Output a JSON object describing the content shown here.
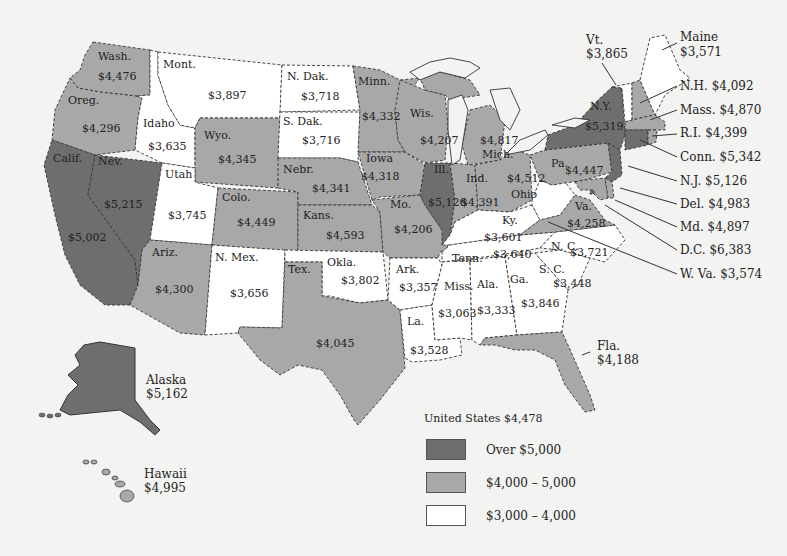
{
  "colors": {
    "over_5000": "#6e6e6e",
    "range_4000_5000": "#a8a8a8",
    "range_3000_4000": "#ffffff",
    "background": "#f3f3f1"
  },
  "states": {
    "wash": {
      "name": "Wash.",
      "value": "$4,476",
      "category": "range_4000_5000"
    },
    "oreg": {
      "name": "Oreg.",
      "value": "$4,296",
      "category": "range_4000_5000"
    },
    "calif": {
      "name": "Calif.",
      "value": "$5,002",
      "category": "over_5000"
    },
    "nev": {
      "name": "Nev.",
      "value": "$5,215",
      "category": "over_5000"
    },
    "idaho": {
      "name": "Idaho",
      "value": "$3,635",
      "category": "range_3000_4000"
    },
    "mont": {
      "name": "Mont.",
      "value": "$3,897",
      "category": "range_3000_4000"
    },
    "wyo": {
      "name": "Wyo.",
      "value": "$4,345",
      "category": "range_4000_5000"
    },
    "utah": {
      "name": "Utah",
      "value": "$3,745",
      "category": "range_3000_4000"
    },
    "colo": {
      "name": "Colo.",
      "value": "$4,449",
      "category": "range_4000_5000"
    },
    "ariz": {
      "name": "Ariz.",
      "value": "$4,300",
      "category": "range_4000_5000"
    },
    "nmex": {
      "name": "N. Mex.",
      "value": "$3,656",
      "category": "range_3000_4000"
    },
    "ndak": {
      "name": "N. Dak.",
      "value": "$3,718",
      "category": "range_3000_4000"
    },
    "sdak": {
      "name": "S. Dak.",
      "value": "$3,716",
      "category": "range_3000_4000"
    },
    "nebr": {
      "name": "Nebr.",
      "value": "$4,341",
      "category": "range_4000_5000"
    },
    "kans": {
      "name": "Kans.",
      "value": "$4,593",
      "category": "range_4000_5000"
    },
    "okla": {
      "name": "Okla.",
      "value": "$3,802",
      "category": "range_3000_4000"
    },
    "tex": {
      "name": "Tex.",
      "value": "$4,045",
      "category": "range_4000_5000"
    },
    "minn": {
      "name": "Minn.",
      "value": "$4,332",
      "category": "range_4000_5000"
    },
    "iowa": {
      "name": "Iowa",
      "value": "$4,318",
      "category": "range_4000_5000"
    },
    "mo": {
      "name": "Mo.",
      "value": "$4,206",
      "category": "range_4000_5000"
    },
    "ark": {
      "name": "Ark.",
      "value": "$3,357",
      "category": "range_3000_4000"
    },
    "la": {
      "name": "La.",
      "value": "$3,528",
      "category": "range_3000_4000"
    },
    "wis": {
      "name": "Wis.",
      "value": "$4,207",
      "category": "range_4000_5000"
    },
    "ill": {
      "name": "Ill.",
      "value": "$5,126",
      "category": "over_5000"
    },
    "mich": {
      "name": "Mich.",
      "value": "$4,817",
      "category": "range_4000_5000"
    },
    "ind": {
      "name": "Ind.",
      "value": "$4,391",
      "category": "range_4000_5000"
    },
    "ohio": {
      "name": "Ohio",
      "value": "$4,512",
      "category": "range_4000_5000"
    },
    "ky": {
      "name": "Ky.",
      "value": "$3,601",
      "category": "range_3000_4000"
    },
    "tenn": {
      "name": "Tenn.",
      "value": "$3,640",
      "category": "range_3000_4000"
    },
    "miss": {
      "name": "Miss.",
      "value": "$3,063",
      "category": "range_3000_4000"
    },
    "ala": {
      "name": "Ala.",
      "value": "$3,333",
      "category": "range_3000_4000"
    },
    "ga": {
      "name": "Ga.",
      "value": "$3,846",
      "category": "range_3000_4000"
    },
    "fla": {
      "name": "Fla.",
      "value": "$4,188",
      "category": "range_4000_5000"
    },
    "sc": {
      "name": "S. C.",
      "value": "$3,448",
      "category": "range_3000_4000"
    },
    "nc": {
      "name": "N. C.",
      "value": "$3,721",
      "category": "range_3000_4000"
    },
    "va": {
      "name": "Va.",
      "value": "$4,258",
      "category": "range_4000_5000"
    },
    "wva": {
      "name": "W. Va.",
      "value": "$3,574",
      "category": "range_3000_4000"
    },
    "pa": {
      "name": "Pa.",
      "value": "$4,447",
      "category": "range_4000_5000"
    },
    "ny": {
      "name": "N.Y.",
      "value": "$5,319",
      "category": "over_5000"
    },
    "vt": {
      "name": "Vt.",
      "value": "$3,865",
      "category": "range_3000_4000"
    },
    "maine": {
      "name": "Maine",
      "value": "$3,571",
      "category": "range_3000_4000"
    },
    "nh": {
      "name": "N.H.",
      "value": "$4,092",
      "category": "range_4000_5000"
    },
    "mass": {
      "name": "Mass.",
      "value": "$4,870",
      "category": "range_4000_5000"
    },
    "ri": {
      "name": "R.I.",
      "value": "$4,399",
      "category": "range_4000_5000"
    },
    "conn": {
      "name": "Conn.",
      "value": "$5,342",
      "category": "over_5000"
    },
    "nj": {
      "name": "N.J.",
      "value": "$5,126",
      "category": "over_5000"
    },
    "del": {
      "name": "Del.",
      "value": "$4,983",
      "category": "range_4000_5000"
    },
    "md": {
      "name": "Md.",
      "value": "$4,897",
      "category": "range_4000_5000"
    },
    "dc": {
      "name": "D.C.",
      "value": "$6,383",
      "category": "over_5000"
    },
    "alaska": {
      "name": "Alaska",
      "value": "$5,162",
      "category": "over_5000"
    },
    "hawaii": {
      "name": "Hawaii",
      "value": "$4,995",
      "category": "range_4000_5000"
    }
  },
  "callouts": {
    "nh": "N.H. $4,092",
    "mass": "Mass. $4,870",
    "ri": "R.I. $4,399",
    "conn": "Conn. $5,342",
    "nj": "N.J. $5,126",
    "del": "Del. $4,983",
    "md": "Md. $4,897",
    "dc": "D.C. $6,383",
    "wva": "W. Va. $3,574"
  },
  "legend": {
    "title": "United States $4,478",
    "items": [
      {
        "label": "Over $5,000",
        "category": "over_5000"
      },
      {
        "label": "$4,000 – 5,000",
        "category": "range_4000_5000"
      },
      {
        "label": "$3,000 – 4,000",
        "category": "range_3000_4000"
      }
    ]
  }
}
